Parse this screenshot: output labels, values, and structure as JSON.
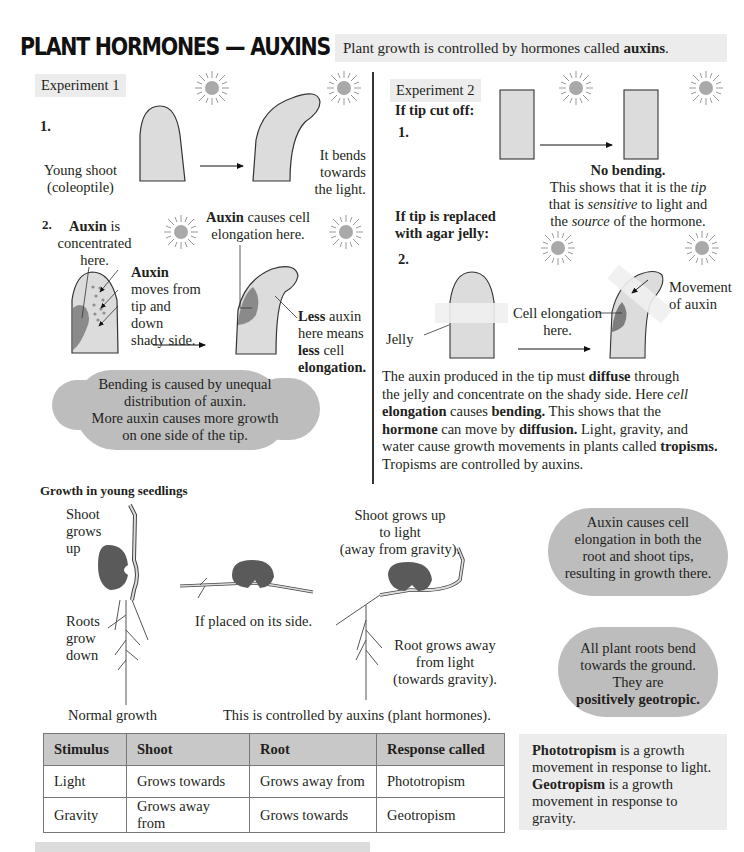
{
  "header": {
    "title": "PLANT HORMONES — AUXINS",
    "intro_pre": "Plant growth is controlled by hormones called ",
    "intro_bold": "auxins",
    "intro_post": "."
  },
  "experiment1": {
    "tag": "Experiment 1",
    "step1": {
      "number": "1.",
      "label_line1": "Young shoot",
      "label_line2": "(coleoptile)",
      "result_line1": "It bends",
      "result_line2": "towards",
      "result_line3": "the light."
    },
    "step2": {
      "number": "2.",
      "concentrated_bold": "Auxin",
      "concentrated_rest": " is",
      "concentrated_line2": "concentrated",
      "concentrated_line3": "here.",
      "moves_bold": "Auxin",
      "moves_line2": "moves from",
      "moves_line3": "tip and",
      "moves_line4": "down",
      "moves_line5": "shady side.",
      "causes_bold": "Auxin",
      "causes_rest": " causes cell",
      "causes_line2": "elongation here.",
      "less_bold": "Less",
      "less_rest": " auxin",
      "less_line2": "here means",
      "less_line3_bold": "less",
      "less_line3_rest": " cell",
      "less_line4_bold": "elongation."
    },
    "cloud": {
      "line1": "Bending is caused by unequal",
      "line2": "distribution of auxin.",
      "line3": "More auxin causes more growth",
      "line4": "on one side of the tip."
    }
  },
  "experiment2": {
    "tag": "Experiment 2",
    "cut_heading": "If tip cut off:",
    "cut_number": "1.",
    "no_bending": "No bending.",
    "shows_line1_pre": "This shows that it is the ",
    "shows_line1_em": "tip",
    "shows_line2_pre": "that is ",
    "shows_line2_em": "sensitive",
    "shows_line2_post": " to light and",
    "shows_line3_pre": "the ",
    "shows_line3_em": "source",
    "shows_line3_post": " of the hormone.",
    "jelly_heading_line1": "If tip is replaced",
    "jelly_heading_line2": "with agar jelly:",
    "jelly_number": "2.",
    "jelly_label": "Jelly",
    "cell_elong_line1": "Cell elongation",
    "cell_elong_line2": "here.",
    "movement_line1": "Movement",
    "movement_line2": "of auxin",
    "para": {
      "l1_a": "The auxin produced in the tip must ",
      "l1_b": "diffuse",
      "l1_c": " through",
      "l2_a": "the jelly and concentrate on the shady  side. Here ",
      "l2_b": "cell",
      "l3_a": "elongation",
      "l3_b": " causes ",
      "l3_c": "bending.",
      "l3_d": " This shows that the",
      "l4_a": "hormone",
      "l4_b": " can move by ",
      "l4_c": "diffusion.",
      "l4_d": " Light, gravity, and",
      "l5_a": "water cause growth movements in plants called ",
      "l5_b": "tropisms.",
      "l6": "Tropisms are controlled by auxins."
    }
  },
  "seedlings": {
    "heading": "Growth in young seedlings",
    "shoot_up_l1": "Shoot",
    "shoot_up_l2": "grows",
    "shoot_up_l3": "up",
    "roots_l1": "Roots",
    "roots_l2": "grow",
    "roots_l3": "down",
    "normal": "Normal growth",
    "side": "If placed on its side.",
    "shoot_light_l1": "Shoot grows up",
    "shoot_light_l2": "to light",
    "shoot_light_l3": "(away from gravity).",
    "root_away_l1": "Root grows away",
    "root_away_l2": "from light",
    "root_away_l3": "(towards gravity).",
    "controlled": "This is controlled by auxins (plant hormones)."
  },
  "clouds_right": {
    "auxin_cloud": {
      "line1": "Auxin causes cell",
      "line2": "elongation in both the",
      "line3": "root and shoot tips,",
      "line4": "resulting in growth there."
    },
    "roots_cloud": {
      "line1": "All plant roots bend",
      "line2": "towards the ground.",
      "line3": "They are",
      "line4_bold": "positively geotropic."
    }
  },
  "table": {
    "headers": [
      "Stimulus",
      "Shoot",
      "Root",
      "Response called"
    ],
    "rows": [
      [
        "Light",
        "Grows towards",
        "Grows away from",
        "Phototropism"
      ],
      [
        "Gravity",
        "Grows away from",
        "Grows towards",
        "Geotropism"
      ]
    ]
  },
  "definitions": {
    "photo_bold": "Phototropism",
    "photo_rest": " is a growth",
    "photo_line2": "movement in response to light.",
    "geo_bold": "Geotropism",
    "geo_rest": " is a growth",
    "geo_line2": "movement in response to",
    "geo_line3": "gravity."
  },
  "colors": {
    "shoot_fill": "#dcdcdc",
    "auxin_dark": "#8a8a8a",
    "seed_dark": "#5a5a5a",
    "cloud_gray": "#bdbdbd",
    "box_gray": "#ececec",
    "table_header": "#c8c8c8"
  }
}
